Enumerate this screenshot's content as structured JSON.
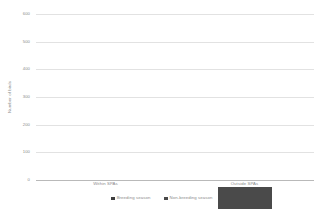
{
  "chart_data": {
    "type": "bar",
    "subtype": "stacked-column",
    "title": "",
    "xlabel": "",
    "ylabel": "Number of birds",
    "categories": [
      "Within SPAs",
      "Outside SPAs"
    ],
    "series": [
      {
        "name": "Breeding season",
        "color": "#3e3e3e",
        "values": [
          90,
          255
        ]
      },
      {
        "name": "Non-breeding season",
        "color": "#4a4a4a",
        "values": [
          157,
          320
        ]
      }
    ],
    "totals": [
      247,
      575
    ],
    "ylim": [
      0,
      600
    ],
    "yticks": [
      0,
      100,
      200,
      300,
      400,
      500,
      600
    ],
    "ytick_labels": [
      "0",
      "100",
      "200",
      "300",
      "400",
      "500",
      "600"
    ],
    "grid": true,
    "legend_position": "bottom",
    "background": "#ffffff",
    "gridline_color": "#e2e2e2",
    "axis_color": "#b9b9b9",
    "text_color": "#8a8a8a"
  }
}
